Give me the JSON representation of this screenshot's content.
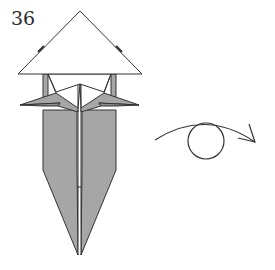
{
  "diagram": {
    "step_number": "36",
    "symbol": "turn-over-arrow-icon",
    "colors": {
      "paper_colored": "#a6a6a6",
      "paper_white": "#ffffff",
      "line": "#333333"
    }
  }
}
